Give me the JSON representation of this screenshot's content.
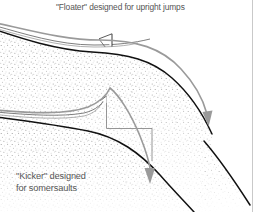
{
  "figure": {
    "width": 260,
    "height": 212,
    "background": "#ffffff",
    "title": "\"Floater\" designed for upright jumps",
    "kicker_label": "\"Kicker\" designed\nfor somersaults",
    "text_color": "#555555"
  },
  "colors": {
    "profile_line": "#111111",
    "trajectory": "#9a9a9a",
    "construction_line": "#7d7d7d",
    "stipple": "#8c8c8c",
    "terrain_fill": "#fbfbfb",
    "border_rule": "#c9c9c9",
    "arrow_head": "#9a9a9a"
  },
  "diagram": {
    "type": "technical-illustration",
    "panels": [
      {
        "name": "floater",
        "label": "\"Floater\" designed for upright jumps",
        "description": "Shallow takeoff ramp producing a long flat trajectory for upright jumps",
        "takeoff_marker": true
      },
      {
        "name": "kicker",
        "label": "\"Kicker\" designed for somersaults",
        "description": "Steep abrupt lip producing a high arcing trajectory for somersaults",
        "takeoff_marker": true
      }
    ],
    "elements": {
      "profile_line_name": "ramp-profile-line",
      "trajectory_name": "trajectory-arrow",
      "construction_name": "construction-line",
      "terrain_name": "terrain-cross-section"
    }
  },
  "paths": {
    "upper_ground": "M -4 30 C 20 38 56 50 92 52 C 128 54 152 60 172 78 C 190 94 202 112 212 134",
    "upper_ramp_top": "M -4 26 C 22 33 58 45 94 46 C 118 47 132 45 150 40",
    "upper_trajectory": "M -4 24 C 26 31 60 42 96 42 C 132 42 160 48 180 68 C 196 84 204 98 209 116",
    "lower_ground": "M -4 116 C 26 120 58 124 88 130 C 118 136 140 152 160 174 C 176 192 188 204 196 214",
    "lower_ramp_top": "M -4 112 C 28 116 62 118 86 114 C 98 112 104 106 107 98",
    "lower_trajectory": "M -4 110 C 30 114 66 116 90 108 C 102 103 108 96 110 90 C 118 96 132 116 142 140 C 148 156 151 166 152 172",
    "right_hill": "M 214 152 C 224 164 236 180 248 200",
    "construction_upper": "M 105 36 L 105 52",
    "construction_lower": "M 107 97 L 107 128 L 152 128 L 152 160"
  }
}
